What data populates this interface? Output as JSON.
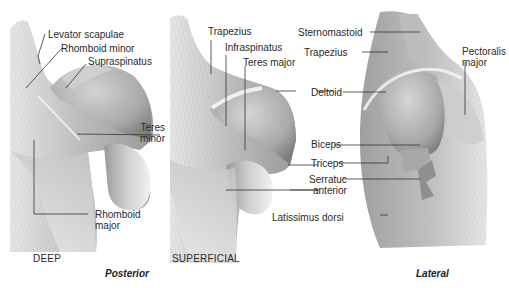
{
  "figure": {
    "panels": [
      {
        "id": "deep",
        "caption": "DEEP",
        "labels": {
          "levator_scapulae": "Levator scapulae",
          "rhomboid_minor": "Rhomboid minor",
          "supraspinatus": "Supraspinatus",
          "teres_minor_1": "Teres",
          "teres_minor_2": "minor",
          "rhomboid_major_1": "Rhomboid",
          "rhomboid_major_2": "major"
        }
      },
      {
        "id": "superficial",
        "caption": "SUPERFICIAL",
        "labels": {
          "trapezius": "Trapezius",
          "infraspinatus": "Infraspinatus",
          "teres_major": "Teres major",
          "latissimus_dorsi": "Latissimus dorsi"
        }
      },
      {
        "id": "lateral",
        "labels": {
          "sternomastoid": "Sternomastoid",
          "trapezius": "Trapezius",
          "deltoid": "Deltoid",
          "biceps": "Biceps",
          "triceps": "Triceps",
          "serratus_anterior_1": "Serratuc",
          "serratus_anterior_2": "anterior",
          "pectoralis_major_1": "Pectoralis",
          "pectoralis_major_2": "major"
        }
      }
    ],
    "section_captions": {
      "posterior": "Posterior",
      "lateral": "Lateral"
    },
    "colors": {
      "muscle_light": "#d9d9d9",
      "muscle_mid": "#b5b5b5",
      "muscle_dark": "#8c8c8c",
      "leader_line": "#333333",
      "background": "#ffffff"
    }
  }
}
